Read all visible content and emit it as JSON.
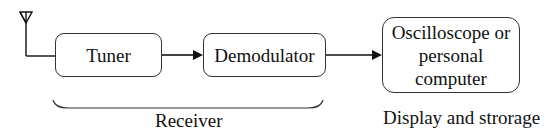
{
  "blocks": {
    "tuner": "Tuner",
    "demodulator": "Demodulator",
    "output_line1": "Oscilloscope or",
    "output_line2": "personal computer"
  },
  "labels": {
    "receiver": "Receiver",
    "display": "Display and strorage"
  },
  "colors": {
    "stroke": "#111111",
    "box_border": "#333333"
  }
}
